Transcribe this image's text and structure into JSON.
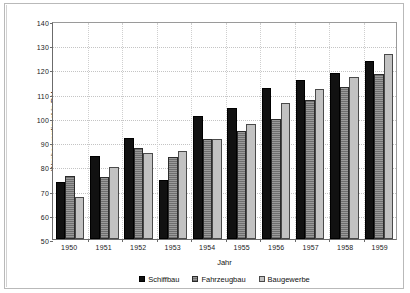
{
  "chart_data": {
    "type": "bar",
    "title": "",
    "xlabel": "Jahr",
    "ylabel": "Wochenverdienst in DM",
    "categories": [
      "1950",
      "1951",
      "1952",
      "1953",
      "1954",
      "1955",
      "1956",
      "1957",
      "1958",
      "1959"
    ],
    "ylim": [
      50,
      140
    ],
    "yticks": [
      50,
      60,
      70,
      80,
      90,
      100,
      110,
      120,
      130,
      140
    ],
    "grid": true,
    "legend_position": "bottom",
    "series": [
      {
        "name": "Schiffbau",
        "color": "#111111",
        "values": [
          73.7,
          84.4,
          91.7,
          74.2,
          100.8,
          104.0,
          112.4,
          115.5,
          118.6,
          123.5
        ]
      },
      {
        "name": "Fahrzeugbau",
        "color": "#8a8a8a",
        "values": [
          76.0,
          75.8,
          87.6,
          83.9,
          91.1,
          94.8,
          99.4,
          107.2,
          112.8,
          118.3
        ]
      },
      {
        "name": "Baugewerbe",
        "color": "#c2c2c2",
        "values": [
          67.4,
          79.8,
          85.6,
          86.2,
          91.4,
          97.5,
          106.3,
          112.0,
          117.0,
          126.2
        ]
      }
    ]
  }
}
